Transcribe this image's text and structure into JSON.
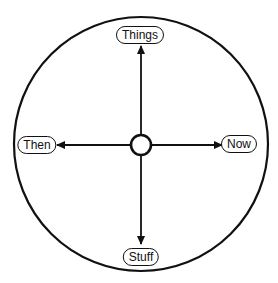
{
  "diagram": {
    "type": "radial-axes",
    "outer_circle": {
      "cx": 141,
      "cy": 144,
      "r": 127
    },
    "center_node": {
      "cx": 141,
      "cy": 145,
      "r": 10
    },
    "labels": {
      "top": "Things",
      "left": "Then",
      "right": "Now",
      "bottom": "Stuff"
    },
    "colors": {
      "stroke": "#111111",
      "background": "#ffffff"
    }
  }
}
